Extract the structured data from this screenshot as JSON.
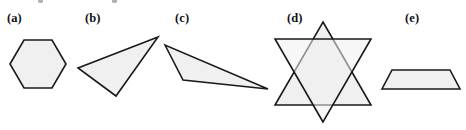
{
  "figure": {
    "width": 466,
    "height": 130,
    "background_color": "#ffffff",
    "shape_fill_color": "#f0f0f0",
    "shape_stroke_color": "#1a1a1a",
    "stroke_width": 1.6
  },
  "panels": [
    {
      "label": "(a)",
      "label_x": 7,
      "label_y": 12,
      "shape_name": "hexagon",
      "points": "10,64 24,40 52,40 66,64 52,88 24,88"
    },
    {
      "label": "(b)",
      "label_x": 85,
      "label_y": 12,
      "shape_name": "acute-triangle",
      "points": "158,37 78,68 116,96"
    },
    {
      "label": "(c)",
      "label_x": 175,
      "label_y": 12,
      "shape_name": "obtuse-triangle",
      "points": "165,45 183,80 268,89"
    },
    {
      "label": "(d)",
      "label_x": 287,
      "label_y": 12,
      "shape_name": "six-pointed-star",
      "triangle_up": "323,22 371,105 275,105",
      "triangle_down": "323,122 275,39 371,39"
    },
    {
      "label": "(e)",
      "label_x": 405,
      "label_y": 12,
      "shape_name": "trapezoid",
      "points": "392,70 450,70 460,89 382,89"
    }
  ],
  "crop_artifacts": [
    {
      "x": 38
    },
    {
      "x": 112
    }
  ]
}
